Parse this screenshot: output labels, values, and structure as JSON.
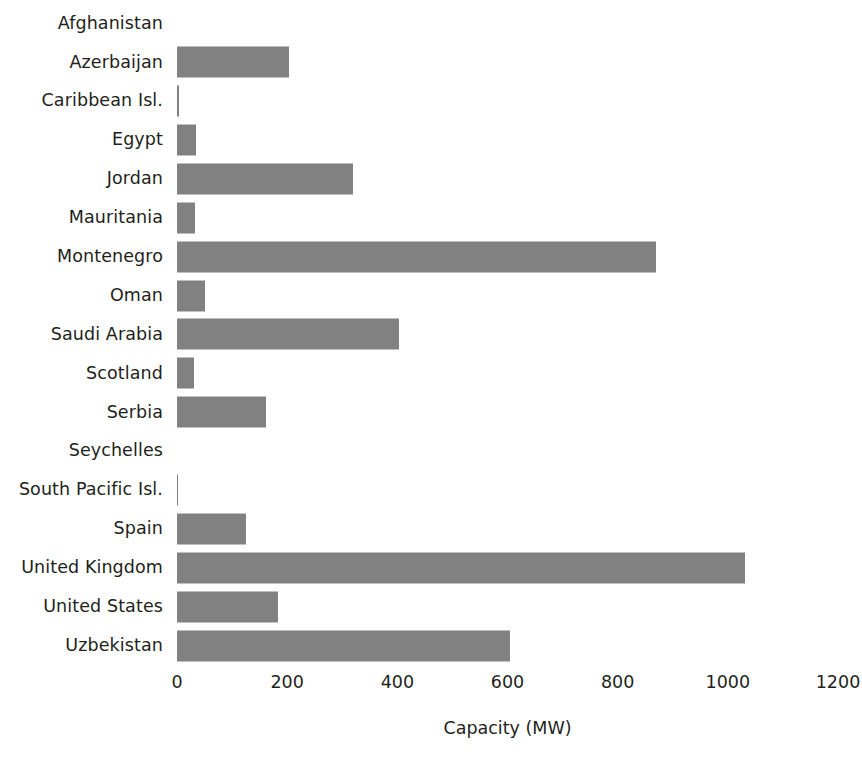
{
  "chart_data": {
    "type": "bar",
    "orientation": "horizontal",
    "title": "",
    "xlabel": "Capacity (MW)",
    "ylabel": "",
    "xlim": [
      0,
      1200
    ],
    "xticks": [
      0,
      200,
      400,
      600,
      800,
      1000,
      1200
    ],
    "xtick_labels": [
      "0",
      "200",
      "400",
      "600",
      "800",
      "1000",
      "1200"
    ],
    "grid": false,
    "legend": null,
    "bar_color": "#818181",
    "categories": [
      "Afghanistan",
      "Azerbaijan",
      "Caribbean Isl.",
      "Egypt",
      "Jordan",
      "Mauritania",
      "Montenegro",
      "Oman",
      "Saudi Arabia",
      "Scotland",
      "Serbia",
      "Seychelles",
      "South Pacific Isl.",
      "Spain",
      "United Kingdom",
      "United States",
      "Uzbekistan"
    ],
    "values": [
      0,
      203,
      3,
      34,
      320,
      32,
      870,
      50,
      403,
      30,
      162,
      0,
      2,
      126,
      1032,
      183,
      604
    ]
  }
}
